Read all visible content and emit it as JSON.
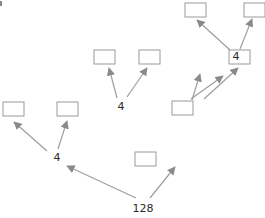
{
  "diagram": {
    "type": "tree",
    "root_label": "128",
    "branch_labels": [
      "4",
      "4",
      "4"
    ],
    "colors": {
      "box_stroke": "#9a9a9a",
      "arrow": "#9e9e9e",
      "text": "#2a2a2a",
      "background": "#ffffff"
    },
    "nodes": [
      {
        "id": "root",
        "label": "128",
        "kind": "text"
      },
      {
        "id": "left-branch",
        "label": "4",
        "kind": "text"
      },
      {
        "id": "center-box",
        "label": "",
        "kind": "box"
      },
      {
        "id": "mid-branch",
        "label": "4",
        "kind": "text"
      },
      {
        "id": "mid-right-box",
        "label": "",
        "kind": "box"
      },
      {
        "id": "top-branch",
        "label": "4",
        "kind": "text"
      },
      {
        "id": "leaf-1",
        "label": "",
        "kind": "box"
      },
      {
        "id": "leaf-2",
        "label": "",
        "kind": "box"
      },
      {
        "id": "leaf-3",
        "label": "",
        "kind": "box"
      },
      {
        "id": "leaf-4",
        "label": "",
        "kind": "box"
      },
      {
        "id": "leaf-5",
        "label": "",
        "kind": "box"
      },
      {
        "id": "leaf-6",
        "label": "",
        "kind": "box"
      },
      {
        "id": "leaf-7",
        "label": "",
        "kind": "box"
      }
    ],
    "edges": [
      [
        "root",
        "left-branch"
      ],
      [
        "root",
        "center-box"
      ],
      [
        "left-branch",
        "leaf-1"
      ],
      [
        "left-branch",
        "leaf-2"
      ],
      [
        "center-box",
        "mid-branch"
      ],
      [
        "center-box",
        "mid-right-box"
      ],
      [
        "mid-branch",
        "leaf-3"
      ],
      [
        "mid-branch",
        "leaf-4"
      ],
      [
        "mid-right-box",
        "top-branch"
      ],
      [
        "mid-right-box",
        "leaf-5"
      ],
      [
        "top-branch",
        "leaf-6"
      ],
      [
        "top-branch",
        "leaf-7"
      ]
    ]
  }
}
